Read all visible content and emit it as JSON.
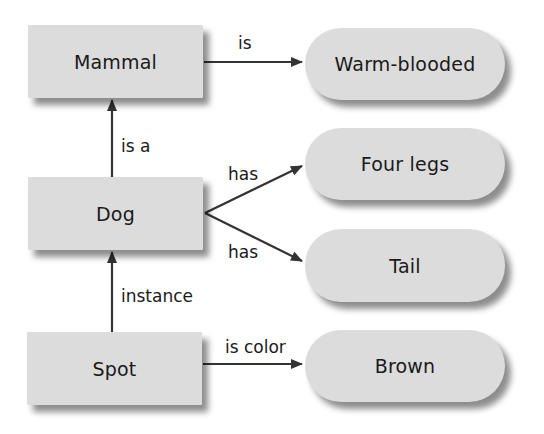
{
  "nodes": {
    "mammal": "Mammal",
    "dog": "Dog",
    "spot": "Spot",
    "warm_blooded": "Warm-blooded",
    "four_legs": "Four legs",
    "tail": "Tail",
    "brown": "Brown"
  },
  "edges": {
    "mammal_warm": "is",
    "dog_mammal": "is a",
    "dog_legs": "has",
    "dog_tail": "has",
    "spot_dog": "instance",
    "spot_brown": "is color"
  },
  "colors": {
    "node_fill": "#dcdcdc",
    "edge": "#333333",
    "text": "#1a1a1a"
  }
}
